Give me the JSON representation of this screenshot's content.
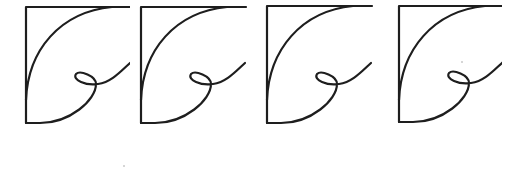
{
  "diagram": {
    "stroke_color": "#1e1e1e",
    "background_color": "#ffffff",
    "figures": [
      {
        "id": 1,
        "left": 0
      },
      {
        "id": 2,
        "left": 122
      },
      {
        "id": 3,
        "left": 248
      },
      {
        "id": 4,
        "left": 372
      }
    ],
    "specks": [
      {
        "x": 123,
        "y": 165
      },
      {
        "x": 461,
        "y": 61
      }
    ]
  }
}
